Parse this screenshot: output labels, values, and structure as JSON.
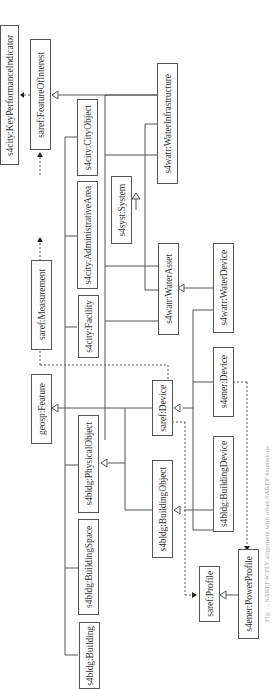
{
  "diagram": {
    "orientation": "rotated-90-ccw",
    "nodes": [
      {
        "id": "kpi",
        "label": "s4city:KeyPerformanceIndicator"
      },
      {
        "id": "foi",
        "label": "saref:FeatureOfInterest"
      },
      {
        "id": "cityobject",
        "label": "s4city:CityObject"
      },
      {
        "id": "waterinfra",
        "label": "s4watr:WaterInfrastructure"
      },
      {
        "id": "admarea",
        "label": "s4city:AdministrativeArea"
      },
      {
        "id": "system",
        "label": "s4syst:System"
      },
      {
        "id": "measurement",
        "label": "saref:Measurement"
      },
      {
        "id": "facility",
        "label": "s4city:Facility"
      },
      {
        "id": "waterasset",
        "label": "s4watr:WaterAsset"
      },
      {
        "id": "waterdevice",
        "label": "s4watr:WaterDevice"
      },
      {
        "id": "feature",
        "label": "geosp:Feature"
      },
      {
        "id": "device",
        "label": "saref:Device"
      },
      {
        "id": "enerdevice",
        "label": "s4ener:Device"
      },
      {
        "id": "physobject",
        "label": "s4bldg:PhysicalObject"
      },
      {
        "id": "bldgobject",
        "label": "s4bldg:BuildingObject"
      },
      {
        "id": "bldgdevice",
        "label": "s4bldg:BuildingDevice"
      },
      {
        "id": "bldgspace",
        "label": "s4bldg:BuildingSpace"
      },
      {
        "id": "profile",
        "label": "saref:Profile"
      },
      {
        "id": "powerprofile",
        "label": "s4ener:PowerProfile"
      },
      {
        "id": "building",
        "label": "s4bldg:Building"
      }
    ],
    "edges": [
      {
        "from": "foi",
        "to": "kpi",
        "type": "dashed-arrow"
      },
      {
        "from": "measurement",
        "to": "foi",
        "type": "dashed-arrow"
      },
      {
        "from": "cityobject",
        "to": "foi",
        "type": "generalization"
      },
      {
        "from": "waterinfra",
        "to": "foi",
        "type": "generalization"
      },
      {
        "from": "admarea",
        "to": "foi",
        "type": "generalization"
      },
      {
        "from": "facility",
        "to": "foi",
        "type": "generalization"
      },
      {
        "from": "waterasset",
        "to": "system",
        "type": "generalization"
      },
      {
        "from": "waterdevice",
        "to": "waterasset",
        "type": "generalization"
      },
      {
        "from": "device",
        "to": "feature",
        "type": "generalization"
      },
      {
        "from": "device",
        "to": "measurement",
        "type": "dashed-arrow"
      },
      {
        "from": "enerdevice",
        "to": "device",
        "type": "generalization"
      },
      {
        "from": "bldgobject",
        "to": "physobject",
        "type": "generalization"
      },
      {
        "from": "bldgdevice",
        "to": "bldgobject",
        "type": "generalization"
      },
      {
        "from": "device",
        "to": "profile",
        "type": "dashed-arrow"
      },
      {
        "from": "powerprofile",
        "to": "profile",
        "type": "generalization"
      },
      {
        "from": "enerdevice",
        "to": "powerprofile",
        "type": "dashed-arrow"
      }
    ]
  },
  "caption": "Fig. ... SAREF4CITY alignment with other SAREF extensions"
}
